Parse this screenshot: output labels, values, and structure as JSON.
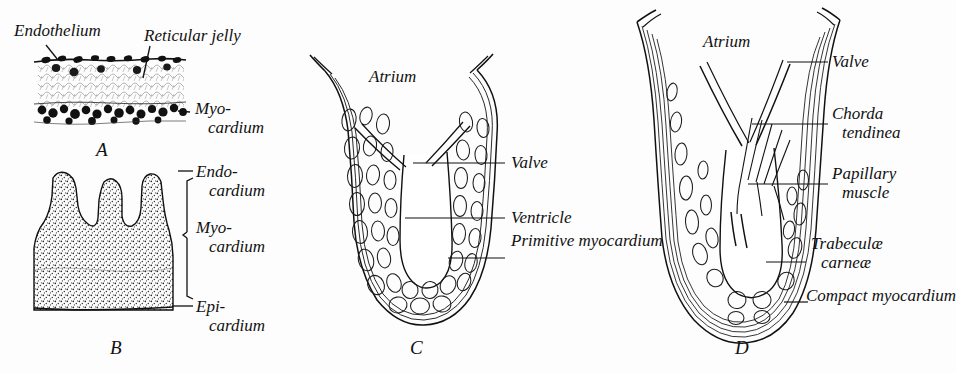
{
  "figure": {
    "background_color": "#fdfdfd",
    "ink_color": "#111111"
  },
  "panels": [
    {
      "id": "A",
      "letter": "A",
      "subject": "early heart wall cross-section: endothelium, reticular jelly, myocardium",
      "labels": [
        {
          "name": "endothelium",
          "text": "Endothelium"
        },
        {
          "name": "reticular-jelly",
          "text": "Reticular jelly"
        },
        {
          "name": "myocardium",
          "line1": "Myo-",
          "line2": "cardium"
        }
      ]
    },
    {
      "id": "B",
      "letter": "B",
      "subject": "trabeculated heart wall: endocardium, myocardium, epicardium with bracket",
      "labels": [
        {
          "name": "endocardium",
          "line1": "Endo-",
          "line2": "cardium"
        },
        {
          "name": "myocardium",
          "line1": "Myo-",
          "line2": "cardium"
        },
        {
          "name": "epicardium",
          "line1": "Epi-",
          "line2": "cardium"
        }
      ]
    },
    {
      "id": "C",
      "letter": "C",
      "subject": "primitive spongy ventricle with atrium and valve",
      "labels": [
        {
          "name": "atrium",
          "text": "Atrium"
        },
        {
          "name": "valve",
          "text": "Valve"
        },
        {
          "name": "ventricle",
          "text": "Ventricle"
        },
        {
          "name": "primitive-myocardium",
          "line1": "Primitive",
          "line2": "myocardium"
        }
      ]
    },
    {
      "id": "D",
      "letter": "D",
      "subject": "mature ventricle with compact myocardium, papillary muscle and chordae",
      "labels": [
        {
          "name": "atrium",
          "text": "Atrium"
        },
        {
          "name": "valve",
          "text": "Valve"
        },
        {
          "name": "chorda-tendinea",
          "line1": "Chorda",
          "line2": "tendinea"
        },
        {
          "name": "papillary-muscle",
          "line1": "Papillary",
          "line2": "muscle"
        },
        {
          "name": "trabeculae-carneae",
          "line1": "Trabeculæ",
          "line2": "carneæ"
        },
        {
          "name": "compact-myocardium",
          "line1": "Compact",
          "line2": "myocardium"
        }
      ]
    }
  ]
}
